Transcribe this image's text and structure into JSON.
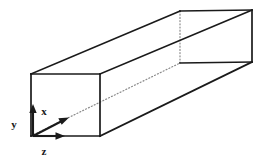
{
  "figure": {
    "type": "3d-oblique-projection",
    "background_color": "#ffffff",
    "line_color": "#1a1a1a",
    "hidden_line_color": "#777777",
    "solid_line_width": 1.6,
    "hidden_line_width": 1.2,
    "hidden_line_style": "dotted"
  },
  "shape": {
    "name": "rectangular-prism",
    "description": "Long rectangular box drawn in oblique projection, front square face at lower left, receding toward upper right.",
    "front_face": {
      "name": "front-face",
      "top_left": [
        31,
        74
      ],
      "top_right": [
        100,
        74
      ],
      "bottom_right": [
        100,
        136
      ],
      "bottom_left": [
        31,
        136
      ]
    },
    "back_face": {
      "name": "back-face",
      "top_left": [
        180,
        11
      ],
      "top_right": [
        252,
        10
      ],
      "bottom_right": [
        252,
        62
      ],
      "bottom_left": [
        180,
        63
      ]
    },
    "visible_edges": [
      {
        "name": "front-top-edge",
        "from": [
          31,
          74
        ],
        "to": [
          100,
          74
        ]
      },
      {
        "name": "front-left-edge",
        "from": [
          31,
          74
        ],
        "to": [
          31,
          136
        ]
      },
      {
        "name": "front-right-edge",
        "from": [
          100,
          74
        ],
        "to": [
          100,
          136
        ]
      },
      {
        "name": "front-bottom-edge",
        "from": [
          31,
          136
        ],
        "to": [
          100,
          136
        ]
      },
      {
        "name": "top-left-receding-edge",
        "from": [
          31,
          74
        ],
        "to": [
          180,
          11
        ]
      },
      {
        "name": "top-right-receding-edge",
        "from": [
          100,
          74
        ],
        "to": [
          252,
          10
        ]
      },
      {
        "name": "bottom-right-receding-edge",
        "from": [
          100,
          136
        ],
        "to": [
          252,
          62
        ]
      },
      {
        "name": "back-top-edge",
        "from": [
          180,
          11
        ],
        "to": [
          252,
          10
        ]
      },
      {
        "name": "back-right-edge",
        "from": [
          252,
          10
        ],
        "to": [
          252,
          62
        ]
      },
      {
        "name": "back-bottom-edge",
        "from": [
          180,
          63
        ],
        "to": [
          252,
          62
        ]
      }
    ],
    "hidden_edges": [
      {
        "name": "back-left-vertical-hidden-edge",
        "from": [
          180,
          11
        ],
        "to": [
          180,
          63
        ]
      },
      {
        "name": "bottom-left-receding-hidden-edge",
        "from": [
          31,
          136
        ],
        "to": [
          180,
          63
        ]
      }
    ]
  },
  "axes": {
    "name": "coordinate-axis-triad",
    "origin": [
      33,
      136
    ],
    "items": [
      {
        "id": "y",
        "label": "y",
        "direction": "up",
        "tip": [
          33,
          106
        ],
        "label_position": [
          14,
          128
        ]
      },
      {
        "id": "x",
        "label": "x",
        "direction": "diagonal-up-right",
        "tip": [
          68,
          119
        ],
        "label_position": [
          44,
          115
        ]
      },
      {
        "id": "z",
        "label": "z",
        "direction": "right",
        "tip": [
          64,
          136
        ],
        "label_position": [
          44,
          152
        ]
      }
    ]
  }
}
